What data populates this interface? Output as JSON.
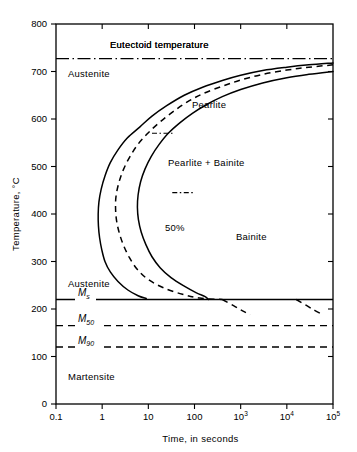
{
  "chart_data": {
    "type": "line",
    "title": "",
    "xlabel": "Time, in seconds",
    "ylabel": "Temperature, °C",
    "xscale": "log",
    "xlim": [
      0.1,
      100000
    ],
    "ylim": [
      0,
      800
    ],
    "grid": false,
    "legend": "none",
    "xticks": [
      {
        "value": 0.1,
        "label": "0.1",
        "sup": ""
      },
      {
        "value": 1,
        "label": "1",
        "sup": ""
      },
      {
        "value": 10,
        "label": "10",
        "sup": ""
      },
      {
        "value": 100,
        "label": "100",
        "sup": ""
      },
      {
        "value": 1000,
        "label": "10",
        "sup": "3"
      },
      {
        "value": 10000,
        "label": "10",
        "sup": "4"
      },
      {
        "value": 100000,
        "label": "10",
        "sup": "5"
      }
    ],
    "yticks": [
      {
        "value": 0,
        "label": "0"
      },
      {
        "value": 100,
        "label": "100"
      },
      {
        "value": 200,
        "label": "200"
      },
      {
        "value": 300,
        "label": "300"
      },
      {
        "value": 400,
        "label": "400"
      },
      {
        "value": 500,
        "label": "500"
      },
      {
        "value": 600,
        "label": "600"
      },
      {
        "value": 700,
        "label": "700"
      },
      {
        "value": 800,
        "label": "800"
      }
    ],
    "series": [
      {
        "name": "transformation-start",
        "style": "solid",
        "points": [
          [
            100000,
            718
          ],
          [
            30000,
            714
          ],
          [
            10000,
            709
          ],
          [
            3000,
            702
          ],
          [
            1000,
            692
          ],
          [
            400,
            681
          ],
          [
            150,
            667
          ],
          [
            60,
            650
          ],
          [
            25,
            628
          ],
          [
            12,
            606
          ],
          [
            6.5,
            583
          ],
          [
            3.5,
            560
          ],
          [
            2.2,
            535
          ],
          [
            1.5,
            508
          ],
          [
            1.15,
            480
          ],
          [
            0.95,
            452
          ],
          [
            0.85,
            425
          ],
          [
            0.82,
            400
          ],
          [
            0.83,
            375
          ],
          [
            0.88,
            350
          ],
          [
            0.98,
            325
          ],
          [
            1.15,
            300
          ],
          [
            1.5,
            278
          ],
          [
            2.2,
            258
          ],
          [
            3.6,
            240
          ],
          [
            6.0,
            228
          ],
          [
            9.0,
            222
          ]
        ]
      },
      {
        "name": "fifty-percent",
        "style": "dashed",
        "points": [
          [
            100000,
            714
          ],
          [
            30000,
            709
          ],
          [
            10000,
            703
          ],
          [
            3000,
            694
          ],
          [
            1000,
            682
          ],
          [
            400,
            669
          ],
          [
            150,
            653
          ],
          [
            70,
            636
          ],
          [
            35,
            616
          ],
          [
            18,
            594
          ],
          [
            10,
            571
          ],
          [
            6,
            547
          ],
          [
            4,
            521
          ],
          [
            2.9,
            494
          ],
          [
            2.3,
            466
          ],
          [
            2.0,
            438
          ],
          [
            1.95,
            412
          ],
          [
            2.05,
            386
          ],
          [
            2.35,
            360
          ],
          [
            2.9,
            334
          ],
          [
            3.9,
            308
          ],
          [
            5.8,
            283
          ],
          [
            10,
            262
          ],
          [
            22,
            244
          ],
          [
            55,
            231
          ],
          [
            130,
            223
          ],
          [
            400,
            220
          ]
        ]
      },
      {
        "name": "transformation-finish",
        "style": "solid",
        "points": [
          [
            100000,
            700
          ],
          [
            30000,
            694
          ],
          [
            10000,
            687
          ],
          [
            3000,
            676
          ],
          [
            1000,
            662
          ],
          [
            400,
            647
          ],
          [
            180,
            630
          ],
          [
            90,
            612
          ],
          [
            48,
            592
          ],
          [
            27,
            570
          ],
          [
            17,
            546
          ],
          [
            11.5,
            521
          ],
          [
            8.5,
            495
          ],
          [
            6.8,
            468
          ],
          [
            6.0,
            440
          ],
          [
            5.8,
            414
          ],
          [
            6.1,
            388
          ],
          [
            7.0,
            362
          ],
          [
            8.8,
            336
          ],
          [
            12,
            310
          ],
          [
            18,
            287
          ],
          [
            31,
            266
          ],
          [
            60,
            248
          ],
          [
            110,
            234
          ],
          [
            170,
            226
          ],
          [
            200,
            220
          ]
        ]
      },
      {
        "name": "bainite-finish-extension",
        "style": "dashed",
        "points": [
          [
            400,
            220
          ],
          [
            700,
            207
          ],
          [
            1100,
            196
          ],
          [
            1600,
            188
          ]
        ]
      },
      {
        "name": "bainite-start-extension",
        "style": "dashed",
        "points": [
          [
            16000,
            220
          ],
          [
            26000,
            208
          ],
          [
            40000,
            197
          ],
          [
            55000,
            190
          ]
        ]
      }
    ],
    "hlines": [
      {
        "name": "eutectoid-temperature",
        "value": 727,
        "style": "dash-dot",
        "label": "Eutectoid temperature",
        "label_x_px": 110,
        "label_y_px": 48
      },
      {
        "name": "Ms",
        "value": 220,
        "style": "solid",
        "label": "M",
        "sub": "s"
      },
      {
        "name": "M50",
        "value": 165,
        "style": "dashed",
        "label": "M",
        "sub": "50"
      },
      {
        "name": "M90",
        "value": 120,
        "style": "dashed",
        "label": "M",
        "sub": "90"
      }
    ],
    "mini_ticks": [
      {
        "name": "pearlite-upper-marker",
        "time": 12,
        "temp": 570,
        "length_px": 22
      },
      {
        "name": "pearlite-lower-marker",
        "time": 33,
        "temp": 445,
        "length_px": 22
      }
    ],
    "annotations": [
      {
        "name": "austenite-upper",
        "text": "Austenite",
        "x_px": 68,
        "y_px": 77
      },
      {
        "name": "austenite-lower",
        "text": "Austenite",
        "x_px": 68,
        "y_px": 287
      },
      {
        "name": "pearlite",
        "text": "Pearlite",
        "x_px": 192,
        "y_px": 108
      },
      {
        "name": "pearlite-bainite",
        "text": "Pearlite + Bainite",
        "x_px": 168,
        "y_px": 166
      },
      {
        "name": "fifty-percent",
        "text": "50%",
        "x_px": 165,
        "y_px": 231
      },
      {
        "name": "bainite",
        "text": "Bainite",
        "x_px": 236,
        "y_px": 240
      },
      {
        "name": "martensite",
        "text": "Martensite",
        "x_px": 68,
        "y_px": 380
      }
    ]
  },
  "plot": {
    "left_px": 56,
    "right_px": 333,
    "top_px": 24,
    "bottom_px": 404
  },
  "colors": {
    "ink": "#000000",
    "background": "#ffffff"
  }
}
